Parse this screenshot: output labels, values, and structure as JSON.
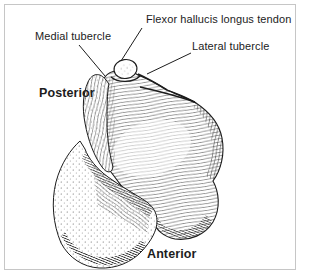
{
  "figure": {
    "annotation_labels": {
      "flexor_hallucis": "Flexor hallucis longus tendon",
      "medial_tubercle": "Medial tubercle",
      "lateral_tubercle": "Lateral tubercle"
    },
    "orientation_labels": {
      "posterior": "Posterior",
      "anterior": "Anterior"
    },
    "colors": {
      "ink": "#1c1c1c",
      "frame_border": "#c6c6c6",
      "background": "#ffffff"
    }
  }
}
